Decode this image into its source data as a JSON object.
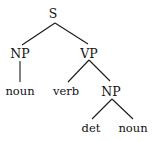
{
  "diagram": {
    "type": "parse-tree",
    "nodes": [
      {
        "id": "S",
        "label": "S",
        "kind": "nonterminal"
      },
      {
        "id": "NP1",
        "label": "NP",
        "kind": "nonterminal"
      },
      {
        "id": "VP",
        "label": "VP",
        "kind": "nonterminal"
      },
      {
        "id": "N1",
        "label": "noun",
        "kind": "terminal"
      },
      {
        "id": "V",
        "label": "verb",
        "kind": "terminal"
      },
      {
        "id": "NP2",
        "label": "NP",
        "kind": "nonterminal"
      },
      {
        "id": "D",
        "label": "det",
        "kind": "terminal"
      },
      {
        "id": "N2",
        "label": "noun",
        "kind": "terminal"
      }
    ],
    "edges": [
      {
        "from": "S",
        "to": "NP1"
      },
      {
        "from": "S",
        "to": "VP"
      },
      {
        "from": "NP1",
        "to": "N1"
      },
      {
        "from": "VP",
        "to": "V"
      },
      {
        "from": "VP",
        "to": "NP2"
      },
      {
        "from": "NP2",
        "to": "D"
      },
      {
        "from": "NP2",
        "to": "N2"
      }
    ]
  }
}
